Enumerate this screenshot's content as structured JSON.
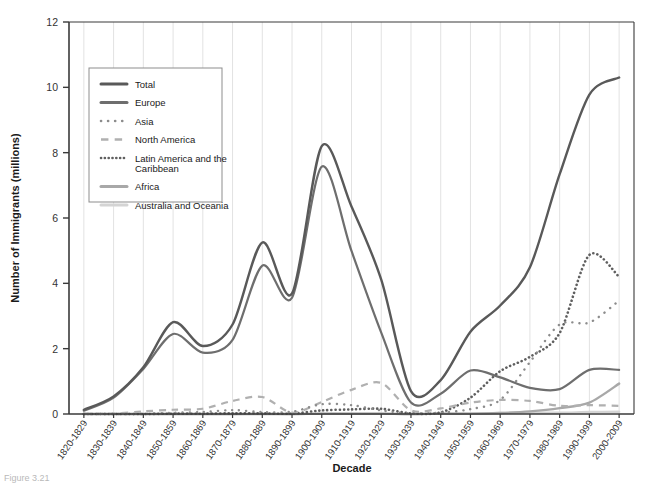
{
  "figure": {
    "background": "#ffffff",
    "plot_background": "#ffffff",
    "axis_color": "#3a3a3a",
    "grid_color": "#e2e2e2",
    "caption": "Figure 3.21"
  },
  "chart_data": {
    "type": "line",
    "title": "",
    "xlabel": "Decade",
    "ylabel": "Number of Immigrants (millions)",
    "ylim": [
      0,
      12
    ],
    "yticks": [
      0,
      2,
      4,
      6,
      8,
      10,
      12
    ],
    "ytick_labels": [
      "0",
      "2",
      "4",
      "6",
      "8",
      "10",
      "12"
    ],
    "grid": "vertical",
    "legend_position": "upper-left-inside",
    "categories": [
      "1820-1829",
      "1830-1839",
      "1840-1849",
      "1850-1859",
      "1860-1869",
      "1870-1879",
      "1880-1889",
      "1890-1899",
      "1900-1909",
      "1910-1919",
      "1920-1929",
      "1930-1939",
      "1940-1949",
      "1950-1959",
      "1960-1969",
      "1970-1979",
      "1980-1989",
      "1990-1999",
      "2000-2009"
    ],
    "series": [
      {
        "name": "Total",
        "color": "#595959",
        "style": "solid",
        "width": 2.4,
        "values": [
          0.13,
          0.54,
          1.43,
          2.81,
          2.08,
          2.74,
          5.25,
          3.69,
          8.2,
          6.35,
          4.11,
          0.7,
          1.04,
          2.52,
          3.32,
          4.49,
          7.34,
          9.78,
          10.3
        ]
      },
      {
        "name": "Europe",
        "color": "#6e6e6e",
        "style": "solid",
        "width": 2.2,
        "values": [
          0.1,
          0.5,
          1.38,
          2.45,
          1.88,
          2.27,
          4.54,
          3.56,
          7.57,
          4.99,
          2.49,
          0.35,
          0.62,
          1.33,
          1.12,
          0.8,
          0.76,
          1.35,
          1.35
        ]
      },
      {
        "name": "Asia",
        "color": "#8c8c8c",
        "style": "dotted-sparse",
        "width": 2.4,
        "values": [
          0.0,
          0.0,
          0.0,
          0.04,
          0.06,
          0.12,
          0.06,
          0.07,
          0.3,
          0.27,
          0.11,
          0.02,
          0.04,
          0.15,
          0.43,
          1.59,
          2.74,
          2.8,
          3.47
        ]
      },
      {
        "name": "North America",
        "color": "#b0b0b0",
        "style": "dashed",
        "width": 2.2,
        "values": [
          0.01,
          0.01,
          0.08,
          0.13,
          0.16,
          0.4,
          0.52,
          0.04,
          0.37,
          0.74,
          0.95,
          0.11,
          0.17,
          0.35,
          0.43,
          0.4,
          0.25,
          0.27,
          0.25
        ]
      },
      {
        "name": "Latin America and the Caribbean",
        "color": "#5f5f5f",
        "style": "dotted-dense",
        "width": 2.6,
        "values": [
          0.0,
          0.0,
          0.0,
          0.01,
          0.01,
          0.02,
          0.02,
          0.01,
          0.11,
          0.14,
          0.16,
          0.02,
          0.05,
          0.5,
          1.31,
          1.75,
          2.48,
          4.87,
          4.2
        ]
      },
      {
        "name": "Africa",
        "color": "#a8a8a8",
        "style": "solid",
        "width": 2.4,
        "values": [
          0.0,
          0.0,
          0.0,
          0.0,
          0.0,
          0.0,
          0.0,
          0.0,
          0.01,
          0.01,
          0.01,
          0.0,
          0.01,
          0.01,
          0.03,
          0.08,
          0.18,
          0.35,
          0.93
        ]
      },
      {
        "name": "Australia and Oceania",
        "color": "#d4d4d4",
        "style": "solid",
        "width": 2.4,
        "values": [
          0.0,
          0.0,
          0.0,
          0.0,
          0.0,
          0.0,
          0.01,
          0.0,
          0.01,
          0.01,
          0.01,
          0.0,
          0.01,
          0.01,
          0.03,
          0.04,
          0.04,
          0.06,
          0.07
        ]
      }
    ]
  },
  "legend": {
    "entries": [
      {
        "label": "Total",
        "color": "#595959",
        "style": "solid"
      },
      {
        "label": "Europe",
        "color": "#6e6e6e",
        "style": "solid"
      },
      {
        "label": "Asia",
        "color": "#8c8c8c",
        "style": "dotted-sparse"
      },
      {
        "label": "North America",
        "color": "#b0b0b0",
        "style": "dashed"
      },
      {
        "label": "Latin America and the",
        "label2": "Caribbean",
        "color": "#5f5f5f",
        "style": "dotted-dense"
      },
      {
        "label": "Africa",
        "color": "#a8a8a8",
        "style": "solid"
      },
      {
        "label": "Australia and Oceania",
        "color": "#d4d4d4",
        "style": "solid"
      }
    ]
  }
}
